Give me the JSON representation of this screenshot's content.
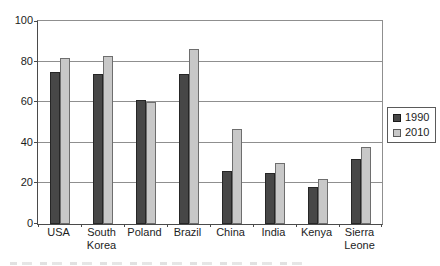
{
  "chart_data": {
    "type": "bar",
    "title": "",
    "xlabel": "",
    "ylabel": "",
    "categories": [
      "USA",
      "South\nKorea",
      "Poland",
      "Brazil",
      "China",
      "India",
      "Kenya",
      "Sierra\nLeone"
    ],
    "series": [
      {
        "name": "1990",
        "color": "#474747",
        "values": [
          75,
          74,
          61,
          74,
          26,
          25,
          18,
          32
        ]
      },
      {
        "name": "2010",
        "color": "#c8c8c8",
        "values": [
          82,
          83,
          60,
          86,
          47,
          30,
          22,
          38
        ]
      }
    ],
    "ylim": [
      0,
      100
    ],
    "yticks": [
      0,
      20,
      40,
      60,
      80,
      100
    ],
    "grid": "horizontal",
    "legend_position": "right-middle-outside"
  },
  "colors": {
    "background": "#ffffff",
    "gridline": "#8f8f8f",
    "axis": "#4a4a4a",
    "text": "#1d1d1d"
  }
}
